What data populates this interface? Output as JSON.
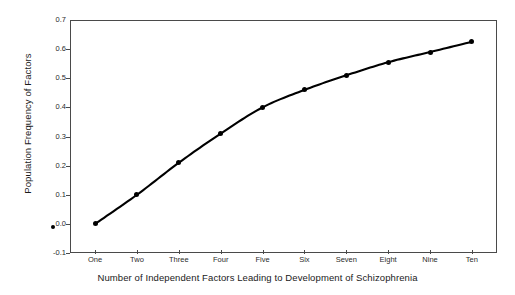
{
  "chart_data": {
    "type": "line",
    "title": "",
    "subtitle": "",
    "xlabel": "Number of Independent Factors Leading to Development of Schizophrenia",
    "ylabel": "Population Frequency of Factors",
    "categories": [
      "One",
      "Two",
      "Three",
      "Four",
      "Five",
      "Six",
      "Seven",
      "Eight",
      "Nine",
      "Ten"
    ],
    "x": [
      1,
      2,
      3,
      4,
      5,
      6,
      7,
      8,
      9,
      10
    ],
    "values": [
      0.0,
      0.1,
      0.21,
      0.31,
      0.4,
      0.46,
      0.51,
      0.555,
      0.59,
      0.625
    ],
    "series": [
      {
        "name": "Population Frequency of Factors",
        "values": [
          0.0,
          0.1,
          0.21,
          0.31,
          0.4,
          0.46,
          0.51,
          0.555,
          0.59,
          0.625
        ],
        "color": "#000000",
        "marker": "filled-circle",
        "linewidth": 2
      }
    ],
    "extra_points": [
      {
        "x": 0,
        "y": -0.01,
        "note": "small marker at y-axis origin"
      }
    ],
    "ylim": [
      -0.1,
      0.7
    ],
    "yticks": [
      -0.1,
      0.0,
      0.1,
      0.2,
      0.3,
      0.4,
      0.5,
      0.6,
      0.7
    ],
    "ytick_labels": [
      "-0.1",
      "0.0",
      "0.1",
      "0.2",
      "0.3",
      "0.4",
      "0.5",
      "0.6",
      "0.7"
    ],
    "xlim": [
      0.4,
      10.6
    ],
    "xtick_labels": [
      "One",
      "Two",
      "Three",
      "Four",
      "Five",
      "Six",
      "Seven",
      "Eight",
      "Nine",
      "Ten"
    ],
    "grid": false,
    "legend": null,
    "legend_position": "none",
    "frame_color": "#4a4a4a",
    "background_color": "#ffffff",
    "tick_direction": "out"
  }
}
